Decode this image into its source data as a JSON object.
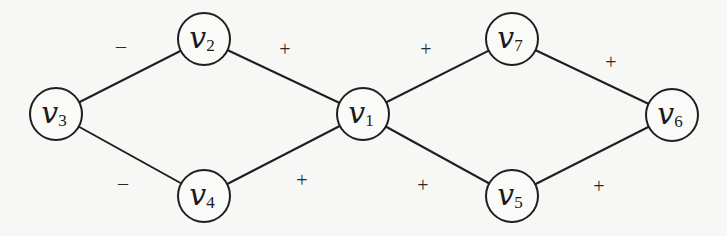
{
  "nodes": [
    {
      "id": "v1",
      "main": "v",
      "sub": "1"
    },
    {
      "id": "v2",
      "main": "v",
      "sub": "2"
    },
    {
      "id": "v3",
      "main": "v",
      "sub": "3"
    },
    {
      "id": "v4",
      "main": "v",
      "sub": "4"
    },
    {
      "id": "v5",
      "main": "v",
      "sub": "5"
    },
    {
      "id": "v6",
      "main": "v",
      "sub": "6"
    },
    {
      "id": "v7",
      "main": "v",
      "sub": "7"
    }
  ],
  "edges": [
    {
      "from": "v3",
      "to": "v2",
      "sign": "–"
    },
    {
      "from": "v3",
      "to": "v4",
      "sign": "–"
    },
    {
      "from": "v2",
      "to": "v1",
      "sign": "+"
    },
    {
      "from": "v4",
      "to": "v1",
      "sign": "+"
    },
    {
      "from": "v1",
      "to": "v7",
      "sign": "+"
    },
    {
      "from": "v1",
      "to": "v5",
      "sign": "+"
    },
    {
      "from": "v7",
      "to": "v6",
      "sign": "+"
    },
    {
      "from": "v5",
      "to": "v6",
      "sign": "+"
    }
  ]
}
